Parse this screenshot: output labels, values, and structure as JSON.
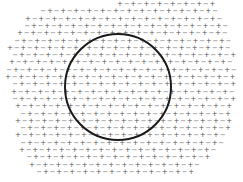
{
  "diagram": {
    "symbols": {
      "positive": "+",
      "negative": "−"
    },
    "colors": {
      "background": "#ffffff",
      "symbol": "#666666",
      "circle_stroke": "#1a1a1a"
    },
    "grid": {
      "col_pitch": 6.6,
      "row_pitch": 7.3,
      "first_row_y": 2,
      "rows": [
        {
          "x0": 120,
          "x1": 215
        },
        {
          "x0": 40,
          "x1": 215
        },
        {
          "x0": 28,
          "x1": 220
        },
        {
          "x0": 24,
          "x1": 228
        },
        {
          "x0": 20,
          "x1": 230
        },
        {
          "x0": 14,
          "x1": 232
        },
        {
          "x0": 10,
          "x1": 234
        },
        {
          "x0": 12,
          "x1": 234
        },
        {
          "x0": 12,
          "x1": 236
        },
        {
          "x0": 6,
          "x1": 236
        },
        {
          "x0": 8,
          "x1": 236
        },
        {
          "x0": 12,
          "x1": 236
        },
        {
          "x0": 14,
          "x1": 234
        },
        {
          "x0": 12,
          "x1": 234
        },
        {
          "x0": 18,
          "x1": 232
        },
        {
          "x0": 20,
          "x1": 232
        },
        {
          "x0": 18,
          "x1": 230
        },
        {
          "x0": 20,
          "x1": 228
        },
        {
          "x0": 18,
          "x1": 226
        },
        {
          "x0": 20,
          "x1": 222
        },
        {
          "x0": 22,
          "x1": 218
        },
        {
          "x0": 26,
          "x1": 210
        },
        {
          "x0": 32,
          "x1": 200
        },
        {
          "x0": 36,
          "x1": 196
        }
      ]
    },
    "circle": {
      "cx": 118,
      "cy": 87,
      "r": 53,
      "stroke_width": 2
    }
  }
}
